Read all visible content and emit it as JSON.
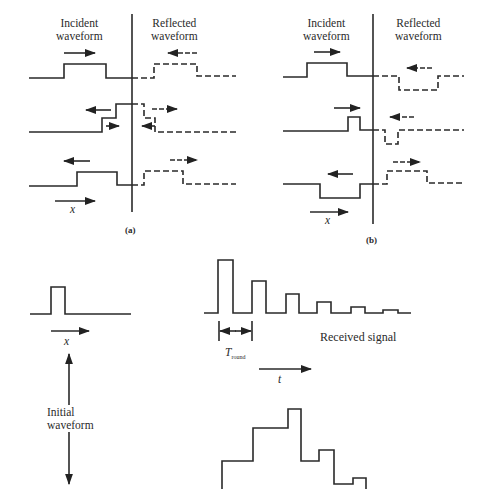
{
  "panel_a": {
    "caption": "(a)",
    "incident_label_line1": "Incident",
    "incident_label_line2": "waveform",
    "reflected_label_line1": "Reflected",
    "reflected_label_line2": "waveform",
    "axis_label": "x",
    "description": "Open-circuit reflection: reflected pulse has same polarity"
  },
  "panel_b": {
    "caption": "(b)",
    "incident_label_line1": "Incident",
    "incident_label_line2": "waveform",
    "reflected_label_line1": "Reflected",
    "reflected_label_line2": "waveform",
    "axis_label": "x",
    "description": "Short-circuit reflection: reflected pulse has inverted polarity"
  },
  "bottom": {
    "initial_waveform_line1": "Initial",
    "initial_waveform_line2": "waveform",
    "initial_axis_label": "x",
    "received_signal_label": "Received signal",
    "t_round_symbol": "T",
    "t_round_subscript": "round",
    "time_axis_label": "t",
    "received_pulse_relative_heights": [
      1.0,
      0.58,
      0.35,
      0.2,
      0.11,
      0.06
    ],
    "staircase_relative_levels": [
      0.35,
      0.78,
      1.0,
      0.36,
      0.48,
      0.07,
      0.14
    ]
  }
}
